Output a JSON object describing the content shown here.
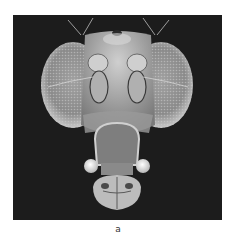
{
  "figure": {
    "background_color": "#1c1c1c",
    "specimen_color": "#b8b8b8"
  },
  "caption": {
    "label": "a"
  }
}
